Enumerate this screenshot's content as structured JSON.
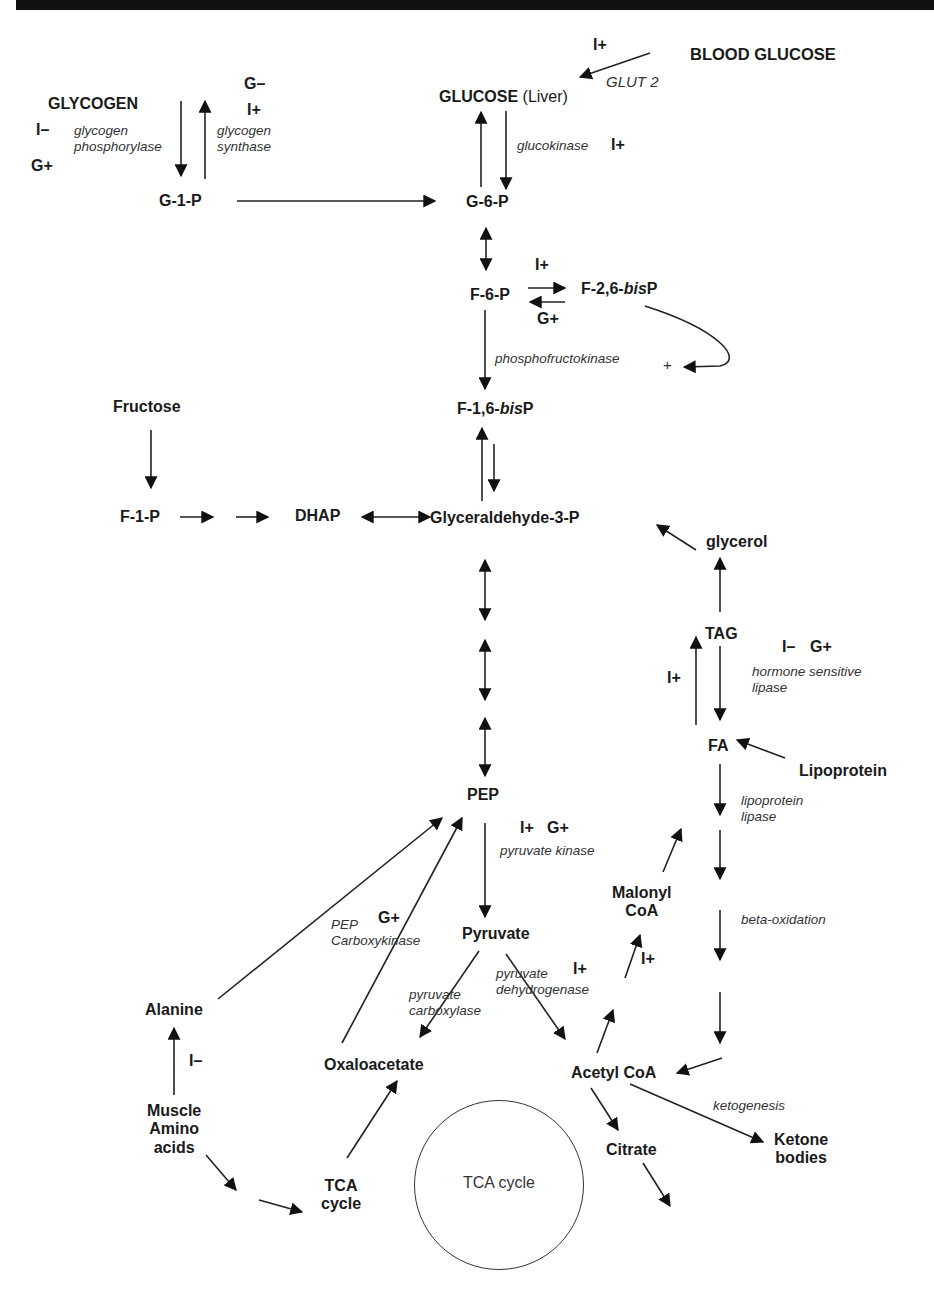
{
  "diagram": {
    "type": "metabolic-pathway",
    "metabolites": {
      "blood_glucose": "BLOOD GLUCOSE",
      "glucose": "GLUCOSE",
      "glucose_qualifier": "(Liver)",
      "glycogen": "GLYCOGEN",
      "g1p": "G-1-P",
      "g6p": "G-6-P",
      "f6p": "F-6-P",
      "f26bisp_prefix": "F-2,6-",
      "f26bisp_italic": "bis",
      "f26bisp_suffix": "P",
      "f16bisp_prefix": "F-1,6-",
      "f16bisp_italic": "bis",
      "f16bisp_suffix": "P",
      "fructose": "Fructose",
      "f1p": "F-1-P",
      "dhap": "DHAP",
      "g3p": "Glyceraldehyde-3-P",
      "glycerol": "glycerol",
      "tag": "TAG",
      "fa": "FA",
      "lipoprotein": "Lipoprotein",
      "pep": "PEP",
      "pyruvate": "Pyruvate",
      "malonyl_coa_1": "Malonyl",
      "malonyl_coa_2": "CoA",
      "alanine": "Alanine",
      "oxaloacetate": "Oxaloacetate",
      "acetyl_coa": "Acetyl CoA",
      "muscle_1": "Muscle",
      "muscle_2": "Amino",
      "muscle_3": "acids",
      "tca_1": "TCA",
      "tca_2": "cycle",
      "citrate": "Citrate",
      "ketone_1": "Ketone",
      "ketone_2": "bodies",
      "tca_circle": "TCA cycle"
    },
    "enzymes": {
      "glut2": "GLUT 2",
      "glycogen_phosphorylase_1": "glycogen",
      "glycogen_phosphorylase_2": "phosphorylase",
      "glycogen_synthase_1": "glycogen",
      "glycogen_synthase_2": "synthase",
      "glucokinase": "glucokinase",
      "phosphofructokinase": "phosphofructokinase",
      "hsl_1": "hormone sensitive",
      "hsl_2": "lipase",
      "lpl_1": "lipoprotein",
      "lpl_2": "lipase",
      "pyruvate_kinase": "pyruvate kinase",
      "pepck_1": "PEP",
      "pepck_2": "Carboxykinase",
      "pc_1": "pyruvate",
      "pc_2": "carboxylase",
      "pdh_1": "pyruvate",
      "pdh_2": "dehydrogenase",
      "beta_oxidation": "beta-oxidation",
      "ketogenesis": "ketogenesis"
    },
    "regulators": {
      "glut2_insulin": "I+",
      "glycogen_synthase_glucagon": "G–",
      "glycogen_synthase_insulin": "I+",
      "glycogen_phosphorylase_insulin": "I–",
      "glycogen_phosphorylase_glucagon": "G+",
      "glucokinase_insulin": "I+",
      "f26bp_insulin": "I+",
      "f26bp_glucagon": "G+",
      "pfk_f26bp_activation": "+",
      "hsl_insulin": "I–",
      "hsl_glucagon": "G+",
      "tag_synthesis_insulin": "I+",
      "pyruvate_kinase_insulin": "I+",
      "pyruvate_kinase_glucagon": "G+",
      "pepck_glucagon": "G+",
      "pdh_insulin": "I+",
      "malonyl_insulin": "I+",
      "alanine_insulin": "I–"
    }
  }
}
